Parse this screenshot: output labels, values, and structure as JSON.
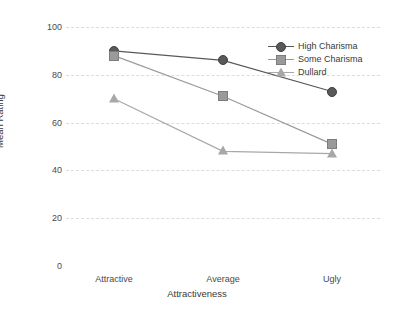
{
  "chart_data": {
    "type": "line",
    "title": "",
    "xlabel": "Attractiveness",
    "ylabel": "Mean Rating",
    "categories": [
      "Attractive",
      "Average",
      "Ugly"
    ],
    "ylim": [
      0,
      100
    ],
    "yticks": [
      0,
      20,
      40,
      60,
      80,
      100
    ],
    "grid": true,
    "legend_position": "top-right",
    "series": [
      {
        "name": "High Charisma",
        "marker": "circle",
        "color": "#595959",
        "values": [
          90,
          86,
          73
        ]
      },
      {
        "name": "Some Charisma",
        "marker": "square",
        "color": "#9a9a9a",
        "values": [
          88,
          71,
          51
        ]
      },
      {
        "name": "Dullard",
        "marker": "triangle",
        "color": "#a8a8a8",
        "values": [
          70,
          48,
          47
        ]
      }
    ]
  },
  "axis": {
    "y_title": "Mean Rating",
    "x_title": "Attractiveness",
    "y_tick_labels": [
      "100",
      "80",
      "60",
      "40",
      "20",
      "0"
    ],
    "x_tick_labels": [
      "Attractive",
      "Average",
      "Ugly"
    ]
  },
  "legend": {
    "entries": [
      {
        "label": "High Charisma"
      },
      {
        "label": "Some Charisma"
      },
      {
        "label": "Dullard"
      }
    ]
  },
  "style": {
    "background": "#ffffff",
    "grid_color": "#d8dde2",
    "text_color": "#3a3a3a"
  }
}
